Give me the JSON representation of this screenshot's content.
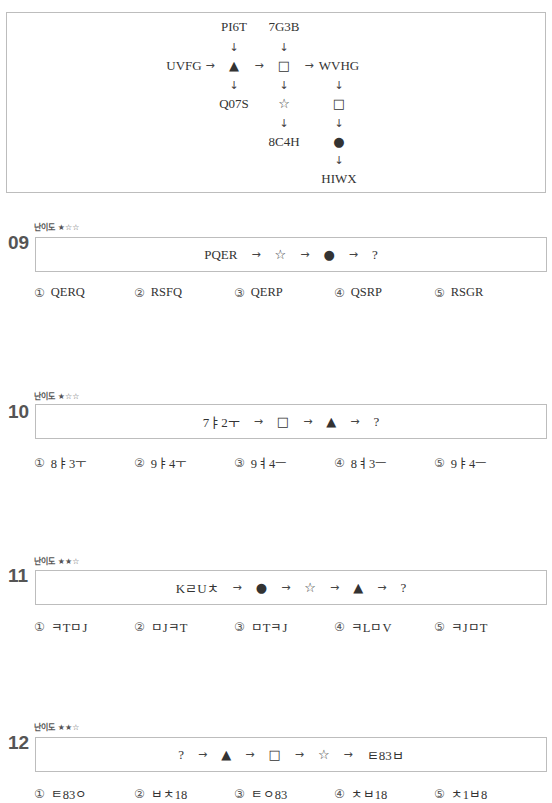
{
  "rule_diagram": {
    "row_main": {
      "start": "UVFG",
      "op1": "▲",
      "op2": "□",
      "end": "WVHG"
    },
    "col_triangle": {
      "top": "PI6T",
      "bottom": "Q07S"
    },
    "col_square": {
      "top": "7G3B",
      "mid": "☆",
      "bottom": "8C4H"
    },
    "col_wvhg": {
      "op1": "□",
      "op2": "●",
      "bottom": "HIWX"
    },
    "arrow_right": "→",
    "arrow_down": "↓"
  },
  "questions": [
    {
      "number": "09",
      "difficulty_label": "난이도",
      "difficulty_stars": "★☆☆",
      "sequence": [
        "PQER",
        "→",
        "☆",
        "→",
        "●",
        "→",
        "?"
      ],
      "options": [
        {
          "marker": "①",
          "text": "QERQ"
        },
        {
          "marker": "②",
          "text": "RSFQ"
        },
        {
          "marker": "③",
          "text": "QERP"
        },
        {
          "marker": "④",
          "text": "QSRP"
        },
        {
          "marker": "⑤",
          "text": "RSGR"
        }
      ]
    },
    {
      "number": "10",
      "difficulty_label": "난이도",
      "difficulty_stars": "★☆☆",
      "sequence": [
        "7ㅑ2ㅜ",
        "→",
        "□",
        "→",
        "▲",
        "→",
        "?"
      ],
      "options": [
        {
          "marker": "①",
          "text": "8ㅑ3ㅜ"
        },
        {
          "marker": "②",
          "text": "9ㅑ4ㅜ"
        },
        {
          "marker": "③",
          "text": "9ㅕ4ㅡ"
        },
        {
          "marker": "④",
          "text": "8ㅕ3ㅡ"
        },
        {
          "marker": "⑤",
          "text": "9ㅑ4ㅡ"
        }
      ]
    },
    {
      "number": "11",
      "difficulty_label": "난이도",
      "difficulty_stars": "★★☆",
      "sequence": [
        "KㄹUㅊ",
        "→",
        "●",
        "→",
        "☆",
        "→",
        "▲",
        "→",
        "?"
      ],
      "options": [
        {
          "marker": "①",
          "text": "ㅋTㅁJ"
        },
        {
          "marker": "②",
          "text": "ㅁJㅋT"
        },
        {
          "marker": "③",
          "text": "ㅁTㅋJ"
        },
        {
          "marker": "④",
          "text": "ㅋLㅁV"
        },
        {
          "marker": "⑤",
          "text": "ㅋJㅁT"
        }
      ]
    },
    {
      "number": "12",
      "difficulty_label": "난이도",
      "difficulty_stars": "★★☆",
      "sequence": [
        "?",
        "→",
        "▲",
        "→",
        "□",
        "→",
        "☆",
        "→",
        "ㅌ83ㅂ"
      ],
      "options": [
        {
          "marker": "①",
          "text": "ㅌ83ㅇ"
        },
        {
          "marker": "②",
          "text": "ㅂㅊ18"
        },
        {
          "marker": "③",
          "text": "ㅌㅇ83"
        },
        {
          "marker": "④",
          "text": "ㅊㅂ18"
        },
        {
          "marker": "⑤",
          "text": "ㅊ1ㅂ8"
        }
      ]
    }
  ]
}
